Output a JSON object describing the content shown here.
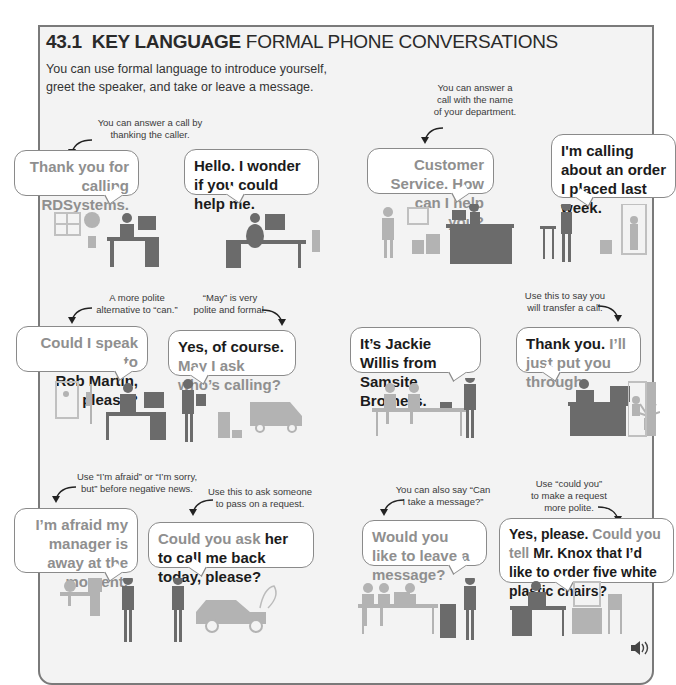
{
  "section": {
    "number": "43.1",
    "title_bold": "KEY LANGUAGE",
    "title_rest": "FORMAL PHONE CONVERSATIONS",
    "intro_line1": "You can use formal language to introduce yourself,",
    "intro_line2": "greet the speaker, and take or leave a message."
  },
  "scenes": [
    {
      "note": [
        "You can answer a call by",
        "thanking the caller."
      ],
      "caller_a": {
        "grey": "Thank you for calling RDSystems.",
        "bold": ""
      },
      "caller_b": {
        "bold": "Hello. I wonder if you could help me.",
        "grey": ""
      }
    },
    {
      "note": [
        "You can answer a",
        "call with the name",
        "of your department."
      ],
      "caller_a": {
        "grey": "Customer Service. How can I help you?",
        "bold": ""
      },
      "caller_b": {
        "bold": "I'm calling about an order I placed last week.",
        "grey": ""
      }
    },
    {
      "note_a": [
        "A more polite",
        "alternative to “can.”"
      ],
      "note_b": [
        "“May” is very",
        "polite and formal."
      ],
      "caller_a": {
        "grey": "Could I speak to",
        "bold": "Rob Martin, please?"
      },
      "caller_b": {
        "bold": "Yes, of course.",
        "grey": "May I ask who’s calling?"
      }
    },
    {
      "note": [
        "Use this to say you",
        "will transfer a call."
      ],
      "caller_a": {
        "bold": "It’s Jackie Willis from Samsite Brothers.",
        "grey": ""
      },
      "caller_b": {
        "bold": "Thank you.",
        "grey": "I’ll just put you through."
      }
    },
    {
      "note_a": [
        "Use “I’m afraid” or “I’m sorry,",
        "but” before negative news."
      ],
      "note_b": [
        "Use this to ask someone",
        "to pass on a request."
      ],
      "caller_a": {
        "grey": "I’m afraid my manager is away at the moment.",
        "bold": ""
      },
      "caller_b": {
        "grey": "Could you ask",
        "bold": "her to call me back today, please?"
      }
    },
    {
      "note_a": [
        "You can also say “Can",
        "I take a message?”"
      ],
      "note_b": [
        "Use “could you”",
        "to make a request",
        "more polite."
      ],
      "caller_a": {
        "grey": "Would you like to leave a message?",
        "bold": ""
      },
      "caller_b": {
        "bold1": "Yes, please.",
        "grey": "Could you tell",
        "bold2": "Mr. Knox that I’d like to order five white plastic chairs?"
      }
    }
  ],
  "audio": {
    "icon": "speaker-icon"
  }
}
